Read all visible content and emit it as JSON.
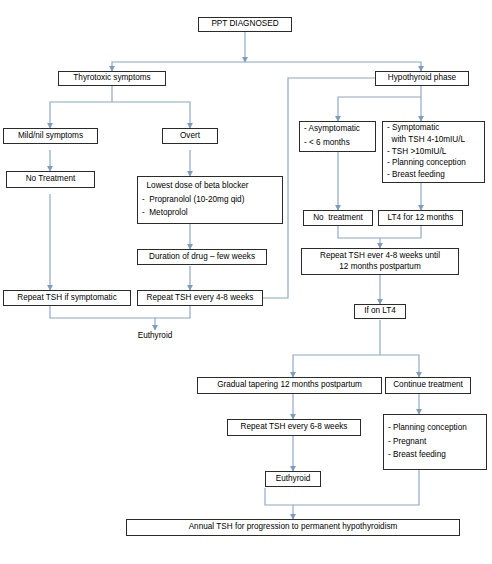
{
  "diagram": {
    "line_color": "#8ba7c4",
    "box_border_color": "#2b2b2b",
    "background": "#ffffff"
  },
  "nodes": {
    "ppt_diagnosed": {
      "lines": [
        "PPT DIAGNOSED"
      ]
    },
    "thyrotoxic_symptoms": {
      "lines": [
        "Thyrotoxic symptoms"
      ]
    },
    "mild_nil_symptoms": {
      "lines": [
        "Mild/nil symptoms"
      ]
    },
    "overt": {
      "lines": [
        "Overt"
      ]
    },
    "no_treatment_left": {
      "lines": [
        "No Treatment"
      ]
    },
    "beta_blocker": {
      "lines": [
        "  Lowest dose of beta blocker",
        "-  Propranolol (10-20mg qid)",
        "-  Metoprolol"
      ]
    },
    "duration_of_drug": {
      "lines": [
        "Duration of drug – few weeks"
      ]
    },
    "repeat_tsh_if_symptomatic": {
      "lines": [
        "Repeat TSH if symptomatic"
      ]
    },
    "repeat_tsh_every_4_8_weeks": {
      "lines": [
        "Repeat TSH every 4-8 weeks"
      ]
    },
    "euthyroid_left": {
      "lines": [
        "Euthyroid"
      ]
    },
    "hypothyroid_phase": {
      "lines": [
        "Hypothyroid phase"
      ]
    },
    "asymptomatic": {
      "lines": [
        "- Asymptomatic",
        "- < 6 months"
      ]
    },
    "symptomatic": {
      "lines": [
        "- Symptomatic",
        "  with TSH 4-10mIU/L",
        "- TSH >10mIU/L",
        "- Planning conception",
        "- Breast feeding"
      ]
    },
    "no_treatment_right": {
      "lines": [
        "No  treatment"
      ]
    },
    "lt4_for_12_months": {
      "lines": [
        "LT4 for 12 months"
      ]
    },
    "repeat_tsh_until_12_months": {
      "lines": [
        "Repeat TSH ever 4-8 weeks until",
        "12 months postpartum"
      ]
    },
    "if_on_lt4": {
      "lines": [
        "If on LT4"
      ]
    },
    "gradual_tapering": {
      "lines": [
        "Gradual tapering 12 months postpartum"
      ]
    },
    "continue_treatment": {
      "lines": [
        "Continue treatment"
      ]
    },
    "repeat_tsh_every_6_8_weeks": {
      "lines": [
        "Repeat TSH every 6-8 weeks"
      ]
    },
    "continue_reasons": {
      "lines": [
        "- Planning conception",
        "- Pregnant",
        "- Breast feeding"
      ]
    },
    "euthyroid_bottom": {
      "lines": [
        "Euthyroid"
      ]
    },
    "annual_tsh": {
      "lines": [
        "Annual TSH for progression to permanent hypothyroidism"
      ]
    }
  }
}
